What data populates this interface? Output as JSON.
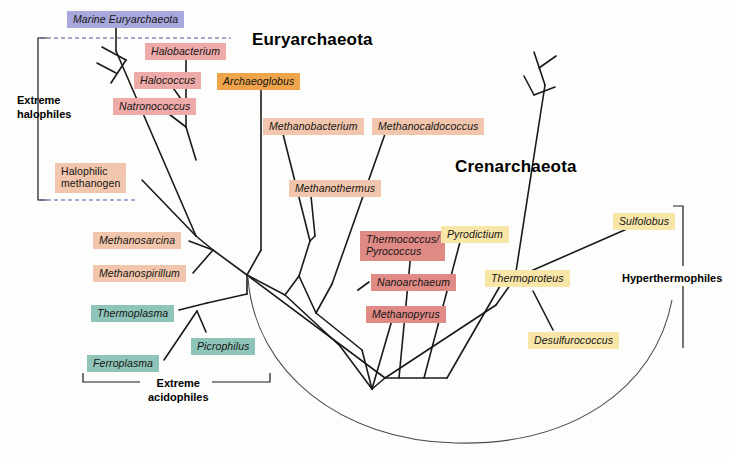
{
  "figure": {
    "type": "phylogenetic-tree"
  },
  "domains": [
    {
      "name": "euryarchaeota",
      "label": "Euryarchaeota",
      "x": 252,
      "y": 30
    },
    {
      "name": "crenarchaeota",
      "label": "Crenarchaeota",
      "x": 455,
      "y": 157
    }
  ],
  "groups": [
    {
      "name": "extreme-halophiles",
      "label": "Extreme\nhalophiles",
      "x": 17,
      "y": 94
    },
    {
      "name": "extreme-acidophiles",
      "label": "Extreme\nacidophiles",
      "x": 148,
      "y": 377
    },
    {
      "name": "hyperthermophiles",
      "label": "Hyperthermophiles",
      "x": 622,
      "y": 272
    }
  ],
  "taxa": [
    {
      "name": "marine-euryarchaeota",
      "label": "Marine Euryarchaeota",
      "color": "c-marine",
      "italic": false,
      "x": 67,
      "y": 11,
      "w": 110
    },
    {
      "name": "halobacterium",
      "label": "Halobacterium",
      "color": "c-halo",
      "italic": true,
      "x": 145,
      "y": 43,
      "w": 84
    },
    {
      "name": "halococcus",
      "label": "Halococcus",
      "color": "c-halo",
      "italic": true,
      "x": 134,
      "y": 72,
      "w": 71
    },
    {
      "name": "natronococcus",
      "label": "Natronococcus",
      "color": "c-halo",
      "italic": true,
      "x": 113,
      "y": 98,
      "w": 88
    },
    {
      "name": "archaeoglobus",
      "label": "Archaeoglobus",
      "color": "c-orange",
      "italic": true,
      "x": 217,
      "y": 73,
      "w": 88
    },
    {
      "name": "halophilic-methanogen",
      "label": "Halophilic\nmethanogen",
      "color": "c-methano",
      "italic": false,
      "x": 55,
      "y": 163,
      "w": 85
    },
    {
      "name": "methanobacterium",
      "label": "Methanobacterium",
      "color": "c-methano",
      "italic": true,
      "x": 263,
      "y": 118,
      "w": 110
    },
    {
      "name": "methanocaldococcus",
      "label": "Methanocaldococcus",
      "color": "c-methano",
      "italic": true,
      "x": 372,
      "y": 118,
      "w": 119
    },
    {
      "name": "methanothermus",
      "label": "Methanothermus",
      "color": "c-methano",
      "italic": true,
      "x": 289,
      "y": 180,
      "w": 98
    },
    {
      "name": "methanosarcina",
      "label": "Methanosarcina",
      "color": "c-methano",
      "italic": true,
      "x": 93,
      "y": 232,
      "w": 95
    },
    {
      "name": "methanospirillum",
      "label": "Methanospirillum",
      "color": "c-methano",
      "italic": true,
      "x": 93,
      "y": 265,
      "w": 100
    },
    {
      "name": "thermoplasma",
      "label": "Thermoplasma",
      "color": "c-teal",
      "italic": true,
      "x": 91,
      "y": 305,
      "w": 88
    },
    {
      "name": "picrophilus",
      "label": "Picrophilus",
      "color": "c-teal",
      "italic": true,
      "x": 191,
      "y": 338,
      "w": 72
    },
    {
      "name": "ferroplasma",
      "label": "Ferroplasma",
      "color": "c-teal",
      "italic": true,
      "x": 87,
      "y": 355,
      "w": 76
    },
    {
      "name": "thermococcus-pyrococcus",
      "label": "Thermococcus/\nPyrococcus",
      "color": "c-red",
      "italic": true,
      "x": 360,
      "y": 231,
      "w": 79
    },
    {
      "name": "nanoarchaeum",
      "label": "Nanoarchaeum",
      "color": "c-red",
      "italic": true,
      "x": 371,
      "y": 274,
      "w": 92
    },
    {
      "name": "methanopyrus",
      "label": "Methanopyrus",
      "color": "c-red",
      "italic": true,
      "x": 366,
      "y": 306,
      "w": 90
    },
    {
      "name": "pyrodictium",
      "label": "Pyrodictium",
      "color": "c-yellow",
      "italic": true,
      "x": 441,
      "y": 226,
      "w": 71
    },
    {
      "name": "thermoproteus",
      "label": "Thermoproteus",
      "color": "c-yellow",
      "italic": true,
      "x": 485,
      "y": 270,
      "w": 88
    },
    {
      "name": "desulfurococcus",
      "label": "Desulfurococcus",
      "color": "c-yellow",
      "italic": true,
      "x": 528,
      "y": 332,
      "w": 96
    },
    {
      "name": "sulfolobus",
      "label": "Sulfolobus",
      "color": "c-yellow",
      "italic": true,
      "x": 613,
      "y": 213,
      "w": 66
    }
  ],
  "colors": {
    "marine": "#a9a8dd",
    "halophile": "#eeaaa8",
    "archaeoglobus": "#eda44b",
    "methanogen": "#f2c6ac",
    "acidophile": "#8fc4b8",
    "thermophile_red": "#e08a86",
    "thermophile_yellow": "#f8e5a8",
    "branch": "#1a1a1a",
    "background": "#fdfdfb"
  }
}
